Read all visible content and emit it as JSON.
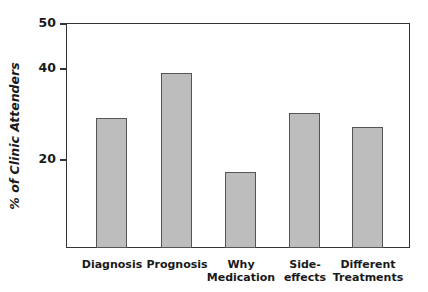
{
  "chart_data": {
    "type": "bar",
    "title": "",
    "xlabel": "",
    "ylabel": "% of Clinic Attenders",
    "categories": [
      "Diagnosis",
      "Prognosis",
      "Why Medication",
      "Side-effects",
      "Different Treatments"
    ],
    "category_labels_display": [
      "Diagnosis",
      "Prognosis",
      "Why\nMedication",
      "Side-\neffects",
      "Different\nTreatments"
    ],
    "values": [
      29,
      39,
      17,
      30,
      27
    ],
    "ylim": [
      0,
      50
    ],
    "yticks": [
      20,
      40,
      50
    ],
    "grid": false,
    "legend": null,
    "bar_color": "#bdbdbd"
  }
}
